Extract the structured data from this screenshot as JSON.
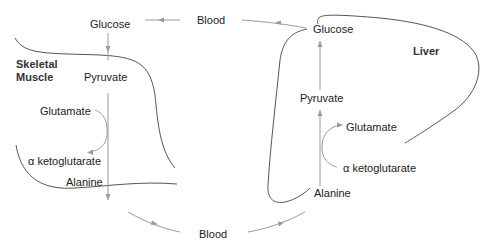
{
  "diagram": {
    "compartments": {
      "muscle": {
        "label_line1": "Skeletal",
        "label_line2": "Muscle"
      },
      "liver": {
        "label": "Liver"
      },
      "blood_top": {
        "label": "Blood"
      },
      "blood_bottom": {
        "label": "Blood"
      }
    },
    "muscle_nodes": {
      "glucose": "Glucose",
      "pyruvate": "Pyruvate",
      "glutamate": "Glutamate",
      "alpha_kg": "α ketoglutarate",
      "alanine": "Alanine"
    },
    "liver_nodes": {
      "glucose": "Glucose",
      "pyruvate": "Pyruvate",
      "glutamate": "Glutamate",
      "alpha_kg": "α ketoglutarate",
      "alanine": "Alanine"
    },
    "edges": [
      {
        "from": "Blood (top)",
        "to": "Glucose (muscle)"
      },
      {
        "from": "Glucose (liver)",
        "to": "Blood (top)"
      },
      {
        "from": "Glucose (muscle)",
        "to": "Pyruvate (muscle)"
      },
      {
        "from": "Pyruvate (muscle)",
        "to": "Alanine (muscle)"
      },
      {
        "from": "Glutamate (muscle)",
        "to": "α ketoglutarate (muscle)"
      },
      {
        "from": "Alanine (muscle)",
        "to": "Blood (bottom)"
      },
      {
        "from": "Blood (bottom)",
        "to": "Alanine (liver)"
      },
      {
        "from": "Alanine (liver)",
        "to": "Pyruvate (liver)"
      },
      {
        "from": "α ketoglutarate (liver)",
        "to": "Glutamate (liver)"
      },
      {
        "from": "Pyruvate (liver)",
        "to": "Glucose (liver)"
      }
    ],
    "colors": {
      "membrane": "#555555",
      "flow_arrow": "#9a9a9a",
      "text": "#222222"
    }
  }
}
